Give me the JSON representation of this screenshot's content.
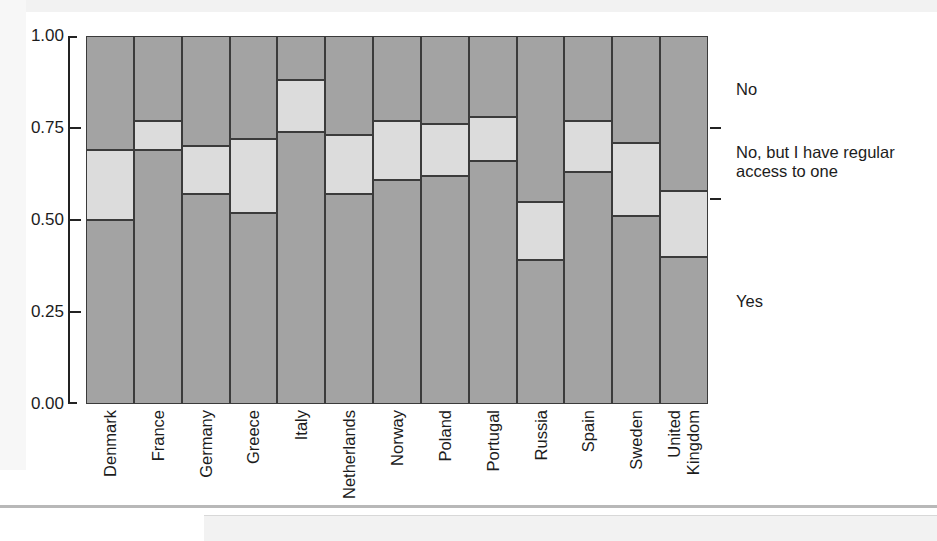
{
  "chart_data": {
    "type": "bar",
    "subtype": "stacked-bar-proportion",
    "title": "",
    "xlabel": "",
    "ylabel": "",
    "ylim": [
      0.0,
      1.0
    ],
    "yticks": [
      "0.00",
      "0.25",
      "0.50",
      "0.75",
      "1.00"
    ],
    "ytick_values": [
      0.0,
      0.25,
      0.5,
      0.75,
      1.0
    ],
    "grid": false,
    "legend_position": "right-axis-labels",
    "categories": [
      "Denmark",
      "France",
      "Germany",
      "Greece",
      "Italy",
      "Netherlands",
      "Norway",
      "Poland",
      "Portugal",
      "Russia",
      "Spain",
      "Sweden",
      "United Kingdom"
    ],
    "series": [
      {
        "name": "Yes",
        "color": "#a3a3a3",
        "values": [
          0.5,
          0.69,
          0.57,
          0.52,
          0.74,
          0.57,
          0.61,
          0.62,
          0.66,
          0.39,
          0.63,
          0.51,
          0.4
        ]
      },
      {
        "name": "No, but I have regular access to one",
        "color": "#dcdcdc",
        "values": [
          0.19,
          0.08,
          0.13,
          0.2,
          0.14,
          0.16,
          0.16,
          0.14,
          0.12,
          0.16,
          0.14,
          0.2,
          0.18
        ]
      },
      {
        "name": "No",
        "color": "#a3a3a3",
        "values": [
          0.31,
          0.23,
          0.3,
          0.28,
          0.12,
          0.27,
          0.23,
          0.24,
          0.22,
          0.45,
          0.23,
          0.29,
          0.42
        ]
      }
    ],
    "cumulative_boundaries": {
      "lower": [
        0.5,
        0.69,
        0.57,
        0.52,
        0.74,
        0.57,
        0.61,
        0.62,
        0.66,
        0.39,
        0.63,
        0.51,
        0.4
      ],
      "upper": [
        0.69,
        0.77,
        0.7,
        0.72,
        0.88,
        0.73,
        0.77,
        0.76,
        0.78,
        0.55,
        0.77,
        0.71,
        0.58
      ]
    },
    "bar_widths": [
      1,
      1,
      1,
      1,
      1,
      1,
      1,
      1,
      1,
      1,
      1,
      1,
      1
    ],
    "annotations": []
  },
  "axis": {
    "y_labels": [
      "1.00",
      "0.75",
      "0.50",
      "0.25",
      "0.00"
    ],
    "x_labels": [
      {
        "lines": [
          "Denmark"
        ]
      },
      {
        "lines": [
          "France"
        ]
      },
      {
        "lines": [
          "Germany"
        ]
      },
      {
        "lines": [
          "Greece"
        ]
      },
      {
        "lines": [
          "Italy"
        ]
      },
      {
        "lines": [
          "Netherlands"
        ]
      },
      {
        "lines": [
          "Norway"
        ]
      },
      {
        "lines": [
          "Poland"
        ]
      },
      {
        "lines": [
          "Portugal"
        ]
      },
      {
        "lines": [
          "Russia"
        ]
      },
      {
        "lines": [
          "Spain"
        ]
      },
      {
        "lines": [
          "Sweden"
        ]
      },
      {
        "lines": [
          "United",
          "Kingdom"
        ]
      }
    ]
  },
  "legend": {
    "entries": [
      {
        "label": "No"
      },
      {
        "label": "No, but I have regular\naccess to one"
      },
      {
        "label": "Yes"
      }
    ]
  },
  "colors": {
    "dark_segment": "#a3a3a3",
    "light_segment": "#dcdcdc",
    "stroke": "#3b3b3b",
    "axis": "#232323",
    "text": "#1c1c1c",
    "background": "#ffffff"
  }
}
